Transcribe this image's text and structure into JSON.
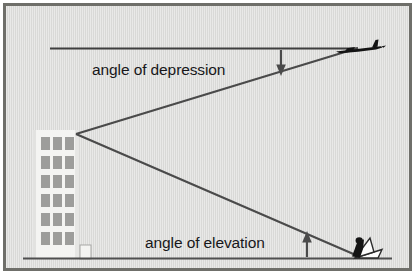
{
  "diagram": {
    "type": "geometry-diagram",
    "background_color": "#d9d9d7",
    "frame_color": "#6f6f6a",
    "line_color": "#4a4a4a",
    "labels": {
      "depression": "angle of depression",
      "elevation": "angle of elevation"
    },
    "objects": {
      "building": {
        "name": "building",
        "facade_color": "#f2f2f0",
        "window_color": "#9a9a98",
        "window_rows": 6,
        "window_cols": 3
      },
      "airplane": {
        "name": "airplane",
        "color": "#111111",
        "position": "top-right"
      },
      "observer": {
        "name": "observer",
        "color": "#111111",
        "position": "bottom-right"
      }
    },
    "lines": {
      "horizontal_reference": "horizontal line of sight from building top",
      "ground": "ground line",
      "sight_line_down": "line of sight from building top down to observer",
      "sight_line_up": "line of sight from building top up to airplane"
    },
    "arrows": {
      "depression_arrow": "arrow pointing down to the angle of depression",
      "elevation_arrow": "arrow pointing up to the angle of elevation"
    }
  }
}
